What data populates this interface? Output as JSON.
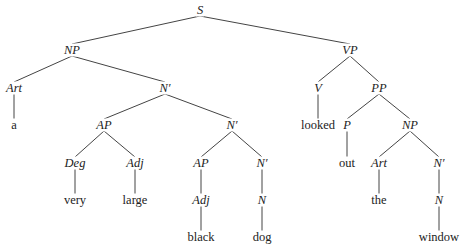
{
  "tree": {
    "nodes": [
      {
        "id": "S",
        "label": "S",
        "type": "cat",
        "x": 200,
        "y": 10
      },
      {
        "id": "NP1",
        "label": "NP",
        "type": "cat",
        "x": 72,
        "y": 50
      },
      {
        "id": "VP",
        "label": "VP",
        "type": "cat",
        "x": 350,
        "y": 50
      },
      {
        "id": "Art1",
        "label": "Art",
        "type": "cat",
        "x": 14,
        "y": 88
      },
      {
        "id": "Nbar1",
        "label": "N′",
        "type": "cat",
        "x": 165,
        "y": 88
      },
      {
        "id": "V",
        "label": "V",
        "type": "cat",
        "x": 318,
        "y": 88
      },
      {
        "id": "PP",
        "label": "PP",
        "type": "cat",
        "x": 379,
        "y": 88
      },
      {
        "id": "a",
        "label": "a",
        "type": "word",
        "x": 14,
        "y": 125
      },
      {
        "id": "AP1",
        "label": "AP",
        "type": "cat",
        "x": 104,
        "y": 125
      },
      {
        "id": "Nbar2",
        "label": "N′",
        "type": "cat",
        "x": 232,
        "y": 125
      },
      {
        "id": "looked",
        "label": "looked",
        "type": "word",
        "x": 318,
        "y": 125
      },
      {
        "id": "P",
        "label": "P",
        "type": "cat",
        "x": 347,
        "y": 125
      },
      {
        "id": "NP2",
        "label": "NP",
        "type": "cat",
        "x": 410,
        "y": 125
      },
      {
        "id": "Deg",
        "label": "Deg",
        "type": "cat",
        "x": 75,
        "y": 163
      },
      {
        "id": "Adj1",
        "label": "Adj",
        "type": "cat",
        "x": 135,
        "y": 163
      },
      {
        "id": "AP2",
        "label": "AP",
        "type": "cat",
        "x": 201,
        "y": 163
      },
      {
        "id": "Nbar3",
        "label": "N′",
        "type": "cat",
        "x": 262,
        "y": 163
      },
      {
        "id": "out",
        "label": "out",
        "type": "word",
        "x": 347,
        "y": 163
      },
      {
        "id": "Art2",
        "label": "Art",
        "type": "cat",
        "x": 379,
        "y": 163
      },
      {
        "id": "Nbar4",
        "label": "N′",
        "type": "cat",
        "x": 439,
        "y": 163
      },
      {
        "id": "very",
        "label": "very",
        "type": "word",
        "x": 75,
        "y": 200
      },
      {
        "id": "large",
        "label": "large",
        "type": "word",
        "x": 135,
        "y": 200
      },
      {
        "id": "Adj2",
        "label": "Adj",
        "type": "cat",
        "x": 201,
        "y": 200
      },
      {
        "id": "N1",
        "label": "N",
        "type": "cat",
        "x": 262,
        "y": 200
      },
      {
        "id": "the",
        "label": "the",
        "type": "word",
        "x": 379,
        "y": 200
      },
      {
        "id": "N2",
        "label": "N",
        "type": "cat",
        "x": 439,
        "y": 200
      },
      {
        "id": "black",
        "label": "black",
        "type": "word",
        "x": 201,
        "y": 237
      },
      {
        "id": "dog",
        "label": "dog",
        "type": "word",
        "x": 262,
        "y": 237
      },
      {
        "id": "window",
        "label": "window",
        "type": "word",
        "x": 439,
        "y": 237
      }
    ],
    "edges": [
      [
        "S",
        "NP1"
      ],
      [
        "S",
        "VP"
      ],
      [
        "NP1",
        "Art1"
      ],
      [
        "NP1",
        "Nbar1"
      ],
      [
        "VP",
        "V"
      ],
      [
        "VP",
        "PP"
      ],
      [
        "Art1",
        "a"
      ],
      [
        "Nbar1",
        "AP1"
      ],
      [
        "Nbar1",
        "Nbar2"
      ],
      [
        "V",
        "looked"
      ],
      [
        "PP",
        "P"
      ],
      [
        "PP",
        "NP2"
      ],
      [
        "AP1",
        "Deg"
      ],
      [
        "AP1",
        "Adj1"
      ],
      [
        "Nbar2",
        "AP2"
      ],
      [
        "Nbar2",
        "Nbar3"
      ],
      [
        "P",
        "out"
      ],
      [
        "NP2",
        "Art2"
      ],
      [
        "NP2",
        "Nbar4"
      ],
      [
        "Deg",
        "very"
      ],
      [
        "Adj1",
        "large"
      ],
      [
        "AP2",
        "Adj2"
      ],
      [
        "Nbar3",
        "N1"
      ],
      [
        "Art2",
        "the"
      ],
      [
        "Nbar4",
        "N2"
      ],
      [
        "Adj2",
        "black"
      ],
      [
        "N1",
        "dog"
      ],
      [
        "N2",
        "window"
      ]
    ]
  },
  "colors": {
    "line": "#444444",
    "text": "#222222",
    "background": "#ffffff"
  }
}
